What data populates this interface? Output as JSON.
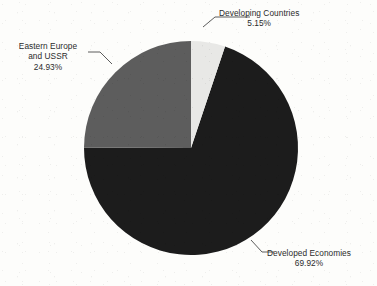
{
  "chart_data": {
    "type": "pie",
    "title": "",
    "legend_position": "none",
    "labels_inline": true,
    "start_angle_deg": 0,
    "direction": "clockwise",
    "center": {
      "x": 191,
      "y": 148
    },
    "radius": 107,
    "categories": [
      "Developing Countries",
      "Developed Economies",
      "Eastern Europe and USSR"
    ],
    "values": [
      5.15,
      69.92,
      24.93
    ],
    "unit": "%",
    "slices": [
      {
        "name": "Developing Countries",
        "label_line1": "Developing Countries",
        "label_line2": "5.15%",
        "value": 5.15,
        "color": "#e8e8e6",
        "start_deg": 0,
        "end_deg": 18.54
      },
      {
        "name": "Developed Economies",
        "label_line1": "Developed Economies",
        "label_line2": "69.92%",
        "value": 69.92,
        "color": "#1c1c1c",
        "start_deg": 18.54,
        "end_deg": 270.25
      },
      {
        "name": "Eastern Europe and USSR",
        "label_line1": "Eastern Europe",
        "label_line2": "and USSR",
        "label_line3": "24.93%",
        "value": 24.93,
        "color": "#5d5d5d",
        "start_deg": 270.25,
        "end_deg": 360
      }
    ]
  },
  "colors": {
    "background": "#fdfdfb",
    "developing": "#e8e8e6",
    "developed": "#1c1c1c",
    "eastern_europe": "#5d5d5d",
    "leader_line": "#4a4a4a",
    "text": "#2b2b2b"
  }
}
